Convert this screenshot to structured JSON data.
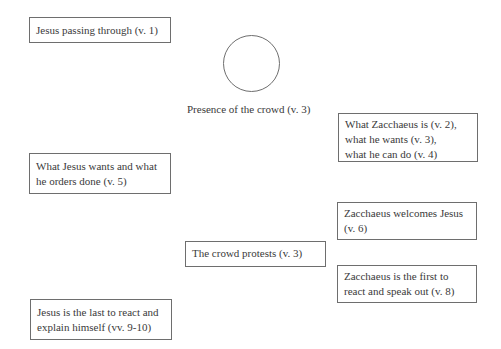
{
  "diagram": {
    "nodes": [
      {
        "id": "jesus-passing",
        "shape": "box",
        "lines": [
          "Jesus passing through (v. 1)"
        ]
      },
      {
        "id": "crowd-presence",
        "shape": "circle",
        "label": "Presence of the crowd (v. 3)"
      },
      {
        "id": "zacchaeus-is",
        "shape": "box",
        "lines": [
          "What Zacchaeus is (v. 2),",
          "what he wants (v. 3),",
          "what he can do (v. 4)"
        ]
      },
      {
        "id": "jesus-wants",
        "shape": "box",
        "lines": [
          "What Jesus wants and what",
          "he orders done (v. 5)"
        ]
      },
      {
        "id": "zacchaeus-welcomes",
        "shape": "box",
        "lines": [
          "Zacchaeus welcomes Jesus",
          "(v. 6)"
        ]
      },
      {
        "id": "crowd-protests",
        "shape": "box",
        "lines": [
          "The crowd protests (v. 3)"
        ]
      },
      {
        "id": "zacchaeus-first",
        "shape": "box",
        "lines": [
          "Zacchaeus is the first to",
          "react and speak out (v. 8)"
        ]
      },
      {
        "id": "jesus-last",
        "shape": "box",
        "lines": [
          "Jesus is the last to react and",
          "explain himself (vv. 9-10)"
        ]
      }
    ],
    "colors": {
      "border": "#6e6e6e",
      "text": "#3a3a3a",
      "background": "#ffffff"
    }
  }
}
